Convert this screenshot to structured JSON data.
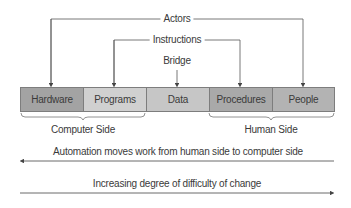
{
  "top_labels": {
    "actors": "Actors",
    "instructions": "Instructions",
    "bridge": "Bridge"
  },
  "components": [
    {
      "label": "Hardware",
      "color": "#a3a3a3"
    },
    {
      "label": "Programs",
      "color": "#d0d0d0"
    },
    {
      "label": "Data",
      "color": "#c6c6c6"
    },
    {
      "label": "Procedures",
      "color": "#a9a9a9"
    },
    {
      "label": "People",
      "color": "#b3b3b3"
    }
  ],
  "groups": {
    "computer_side": "Computer Side",
    "human_side": "Human Side"
  },
  "arrows": {
    "automation": "Automation moves work from human side to computer side",
    "difficulty": "Increasing degree of difficulty of change"
  }
}
